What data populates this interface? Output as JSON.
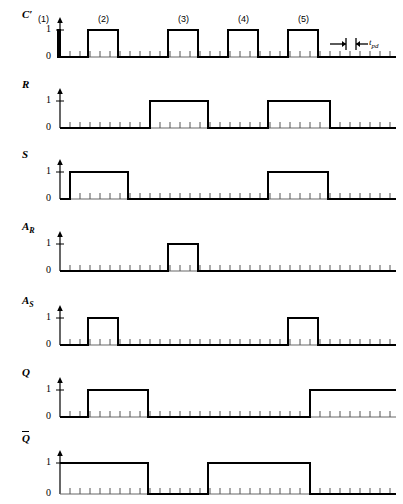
{
  "figure": {
    "type": "timing-diagram",
    "width": 403,
    "height": 504,
    "line_color": "#000000",
    "background": "#ffffff"
  },
  "axis": {
    "x_start": 60,
    "x_end": 396,
    "level_labels": [
      "0",
      "1"
    ],
    "tick_spacing": 10,
    "tick_height": 6
  },
  "clock_marks": [
    {
      "label": "(1)",
      "x": 38
    },
    {
      "label": "(2)",
      "x": 98
    },
    {
      "label": "(3)",
      "x": 178
    },
    {
      "label": "(4)",
      "x": 238
    },
    {
      "label": "(5)",
      "x": 298
    }
  ],
  "annotation": {
    "tpd_label": "t",
    "tpd_sub": "pd",
    "arrow_left_x": 330,
    "arrow_right_x": 368,
    "y": 36
  },
  "rows": [
    {
      "name": "clock",
      "label": "C",
      "label_prime": "′",
      "overline": false,
      "subscript": "",
      "top": 8,
      "baseline_y": 57,
      "high_y": 30,
      "pulses": [
        [
          28,
          58
        ],
        [
          88,
          118
        ],
        [
          168,
          198
        ],
        [
          228,
          258
        ],
        [
          288,
          318
        ]
      ],
      "start_level": 0,
      "end_level": 0
    },
    {
      "name": "R",
      "label": "R",
      "label_prime": "",
      "overline": false,
      "subscript": "",
      "top": 78,
      "baseline_y": 128,
      "high_y": 101,
      "pulses": [
        [
          150,
          208
        ],
        [
          268,
          330
        ]
      ],
      "start_level": 0,
      "end_level": 0
    },
    {
      "name": "S",
      "label": "S",
      "label_prime": "",
      "overline": false,
      "subscript": "",
      "top": 148,
      "baseline_y": 199,
      "high_y": 172,
      "pulses": [
        [
          70,
          128
        ],
        [
          268,
          328
        ]
      ],
      "start_level": 0,
      "end_level": 0
    },
    {
      "name": "A_R",
      "label": "A",
      "label_prime": "",
      "overline": false,
      "subscript": "R",
      "top": 220,
      "baseline_y": 271,
      "high_y": 244,
      "pulses": [
        [
          168,
          198
        ]
      ],
      "start_level": 0,
      "end_level": 0
    },
    {
      "name": "A_S",
      "label": "A",
      "label_prime": "",
      "overline": false,
      "subscript": "S",
      "top": 294,
      "baseline_y": 345,
      "high_y": 318,
      "pulses": [
        [
          88,
          118
        ],
        [
          288,
          318
        ]
      ],
      "start_level": 0,
      "end_level": 0
    },
    {
      "name": "Q",
      "label": "Q",
      "label_prime": "",
      "overline": false,
      "subscript": "",
      "top": 366,
      "baseline_y": 417,
      "high_y": 390,
      "pulses": [
        [
          88,
          148
        ],
        [
          310,
          396
        ]
      ],
      "start_level": 0,
      "end_level": 1
    },
    {
      "name": "Q_bar",
      "label": "Q",
      "label_prime": "",
      "overline": true,
      "subscript": "",
      "top": 432,
      "baseline_y": 494,
      "high_y": 463,
      "pulses": [
        [
          60,
          148
        ],
        [
          208,
          310
        ]
      ],
      "start_level": 1,
      "end_level": 0
    }
  ],
  "chart_data": {
    "type": "line",
    "xlabel": "time",
    "ylabel": "logic level",
    "ylim": [
      0,
      1
    ],
    "series": [
      {
        "name": "C'",
        "high_intervals": [
          [
            28,
            58
          ],
          [
            88,
            118
          ],
          [
            168,
            198
          ],
          [
            228,
            258
          ],
          [
            288,
            318
          ]
        ]
      },
      {
        "name": "R",
        "high_intervals": [
          [
            150,
            208
          ],
          [
            268,
            330
          ]
        ]
      },
      {
        "name": "S",
        "high_intervals": [
          [
            70,
            128
          ],
          [
            268,
            328
          ]
        ]
      },
      {
        "name": "A_R",
        "high_intervals": [
          [
            168,
            198
          ]
        ]
      },
      {
        "name": "A_S",
        "high_intervals": [
          [
            88,
            118
          ],
          [
            288,
            318
          ]
        ]
      },
      {
        "name": "Q",
        "high_intervals": [
          [
            88,
            148
          ],
          [
            310,
            396
          ]
        ]
      },
      {
        "name": "Q_bar",
        "high_intervals": [
          [
            60,
            148
          ],
          [
            208,
            310
          ]
        ]
      }
    ]
  }
}
